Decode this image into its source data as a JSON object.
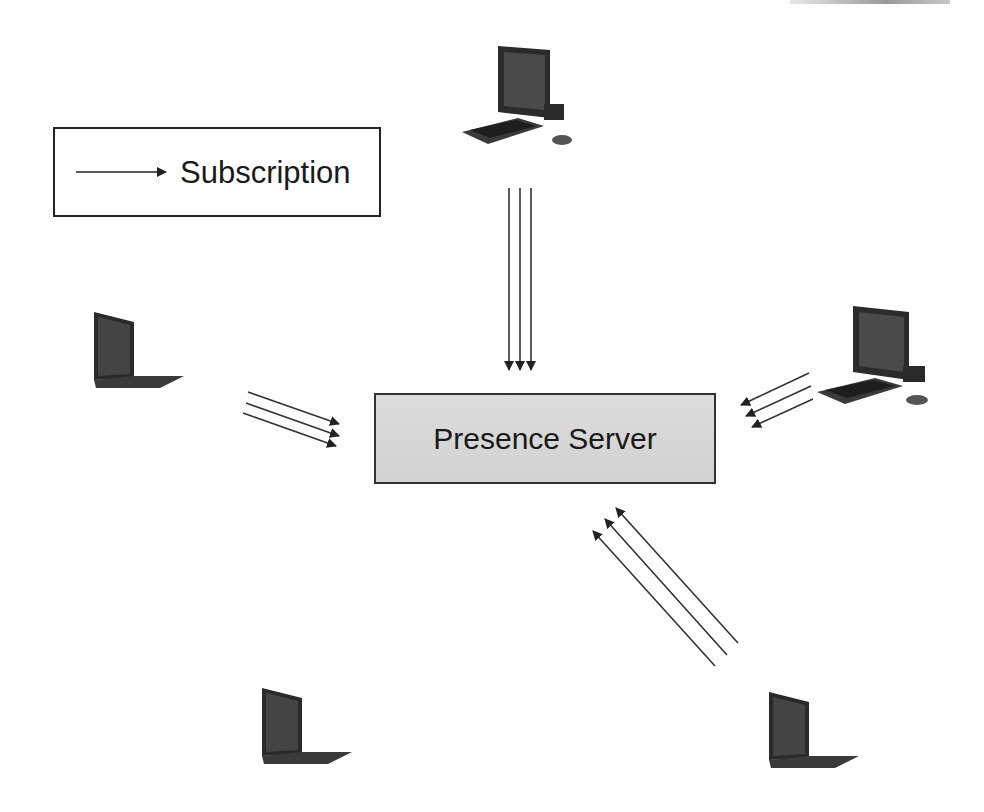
{
  "diagram": {
    "type": "network-subscription",
    "legend": {
      "arrow_label": "Subscription"
    },
    "server": {
      "label": "Presence Server",
      "fill": "#d6d6d6"
    },
    "nodes": [
      {
        "id": "desktop-top",
        "kind": "desktop-computer",
        "position": "top-center",
        "arrows_to_server": 3
      },
      {
        "id": "laptop-left",
        "kind": "laptop",
        "position": "middle-left",
        "arrows_to_server": 3
      },
      {
        "id": "desktop-right",
        "kind": "desktop-computer",
        "position": "middle-right",
        "arrows_to_server": 3
      },
      {
        "id": "laptop-bottom-left",
        "kind": "laptop",
        "position": "bottom-left",
        "arrows_to_server": 0
      },
      {
        "id": "laptop-bottom-right",
        "kind": "laptop",
        "position": "bottom-right",
        "arrows_to_server": 3
      }
    ],
    "colors": {
      "arrow": "#333333",
      "box_border": "#222222",
      "background": "#ffffff"
    }
  }
}
